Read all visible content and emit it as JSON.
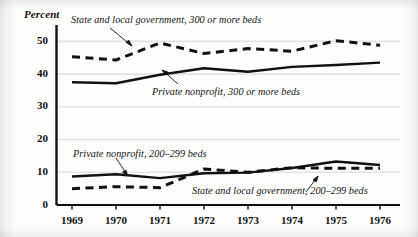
{
  "chart_data": {
    "type": "line",
    "title": "",
    "subtitle": "",
    "xlabel": "",
    "ylabel": "Percent",
    "ylim": [
      0,
      55
    ],
    "xlim": [
      1969,
      1976
    ],
    "grid": true,
    "legend_position": "inline-annotations",
    "categories": [
      "1969",
      "1970",
      "1971",
      "1972",
      "1973",
      "1974",
      "1975",
      "1976"
    ],
    "x": [
      1969,
      1970,
      1971,
      1972,
      1973,
      1974,
      1975,
      1976
    ],
    "y_ticks": [
      "0",
      "10",
      "20",
      "30",
      "40",
      "50"
    ],
    "y_tick_values": [
      0,
      10,
      20,
      30,
      40,
      50
    ],
    "series": [
      {
        "name": "State and local government, 300 or more beds",
        "style": "dashed",
        "values": [
          45.3,
          44.3,
          49.5,
          46.3,
          47.8,
          47.0,
          50.2,
          48.8
        ]
      },
      {
        "name": "Private nonprofit, 300 or more beds",
        "style": "solid",
        "values": [
          37.5,
          37.2,
          39.8,
          41.8,
          40.7,
          42.2,
          42.8,
          43.5
        ]
      },
      {
        "name": "Private nonprofit, 200–299 beds",
        "style": "solid",
        "values": [
          8.7,
          9.4,
          8.2,
          9.7,
          9.9,
          11.3,
          13.3,
          12.2
        ]
      },
      {
        "name": "State and local government, 200–299 beds",
        "style": "dashed",
        "values": [
          5.0,
          5.6,
          5.3,
          11.0,
          10.0,
          11.4,
          11.2,
          11.2
        ]
      }
    ],
    "annotations": [
      {
        "id": "ann-state-300",
        "text": "State and local government, 300 or more beds",
        "points_to_series": "State and local government, 300 or more beds"
      },
      {
        "id": "ann-private-300",
        "text": "Private nonprofit, 300 or more beds",
        "points_to_series": "Private nonprofit, 300 or more beds"
      },
      {
        "id": "ann-private-200",
        "text": "Private nonprofit, 200–299 beds",
        "points_to_series": "Private nonprofit, 200–299 beds"
      },
      {
        "id": "ann-state-200",
        "text": "State and local government, 200–299 beds",
        "points_to_series": "State and local government, 200–299 beds"
      }
    ],
    "colors": {
      "line": "#111111",
      "grid": "#e2e2e2",
      "axis": "#111111",
      "background": "#fdfdfc"
    }
  }
}
